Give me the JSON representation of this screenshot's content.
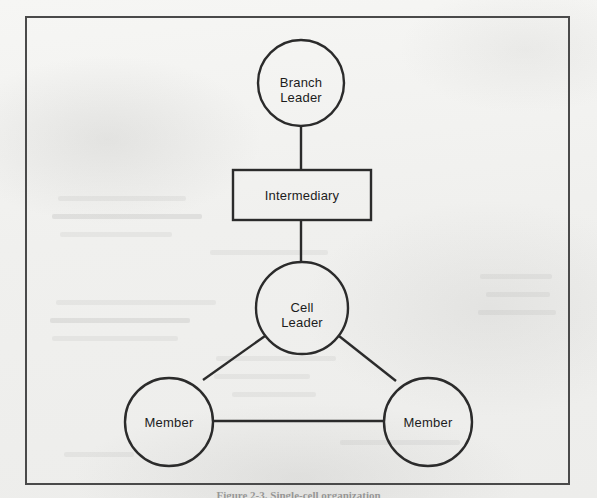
{
  "figure": {
    "caption": "Figure 2-3. Single-cell organization",
    "border_color": "#4a4a4a",
    "line_color": "#2b2b2b",
    "background_color": "#f0f0ee",
    "text_color": "#1c1c1c"
  },
  "diagram": {
    "type": "hierarchy",
    "nodes": [
      {
        "id": "branch-leader",
        "label": "Branch\nLeader",
        "shape": "circle",
        "cx": 301,
        "cy": 83,
        "r": 43
      },
      {
        "id": "intermediary",
        "label": "Intermediary",
        "shape": "rectangle",
        "x": 233,
        "y": 170,
        "width": 138,
        "height": 50
      },
      {
        "id": "cell-leader",
        "label": "Cell\nLeader",
        "shape": "circle",
        "cx": 302,
        "cy": 308,
        "r": 46
      },
      {
        "id": "member-left",
        "label": "Member",
        "shape": "circle",
        "cx": 169,
        "cy": 422,
        "r": 44
      },
      {
        "id": "member-right",
        "label": "Member",
        "shape": "circle",
        "cx": 428,
        "cy": 422,
        "r": 44
      }
    ],
    "edges": [
      {
        "id": "edge-branch-intermediary",
        "from": "branch-leader",
        "to": "intermediary",
        "style": "vertical"
      },
      {
        "id": "edge-intermediary-cell",
        "from": "intermediary",
        "to": "cell-leader",
        "style": "vertical"
      },
      {
        "id": "edge-cell-member-left",
        "from": "cell-leader",
        "to": "member-left",
        "style": "diagonal"
      },
      {
        "id": "edge-cell-member-right",
        "from": "cell-leader",
        "to": "member-right",
        "style": "diagonal"
      },
      {
        "id": "edge-member-member",
        "from": "member-left",
        "to": "member-right",
        "style": "horizontal"
      }
    ]
  }
}
